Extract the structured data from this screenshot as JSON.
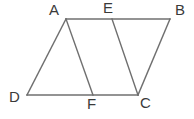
{
  "figure": {
    "kind": "geometry-diagram",
    "canvas": {
      "width": 194,
      "height": 119,
      "background": "#ffffff"
    },
    "style": {
      "line_color": "#6f6f6f",
      "line_width": 1.4,
      "label_color": "#3a3a3a",
      "label_font_size": 15
    },
    "points": [
      {
        "id": "A",
        "label": "A",
        "x": 66,
        "y": 19,
        "label_x": 49,
        "label_y": 2
      },
      {
        "id": "E",
        "label": "E",
        "x": 112,
        "y": 19,
        "label_x": 103,
        "label_y": 0
      },
      {
        "id": "B",
        "label": "B",
        "x": 170,
        "y": 19,
        "label_x": 175,
        "label_y": 2
      },
      {
        "id": "D",
        "label": "D",
        "x": 27,
        "y": 95,
        "label_x": 9,
        "label_y": 89
      },
      {
        "id": "F",
        "label": "F",
        "x": 93,
        "y": 95,
        "label_x": 87,
        "label_y": 96
      },
      {
        "id": "C",
        "label": "C",
        "x": 138,
        "y": 95,
        "label_x": 140,
        "label_y": 95
      }
    ],
    "segments": [
      {
        "id": "AB",
        "from": "A",
        "to": "B",
        "name": "segment-ab"
      },
      {
        "id": "DC",
        "from": "D",
        "to": "C",
        "name": "segment-dc"
      },
      {
        "id": "AD",
        "from": "A",
        "to": "D",
        "name": "segment-ad"
      },
      {
        "id": "AF",
        "from": "A",
        "to": "F",
        "name": "segment-af"
      },
      {
        "id": "EC",
        "from": "E",
        "to": "C",
        "name": "segment-ec"
      },
      {
        "id": "BC",
        "from": "B",
        "to": "C",
        "name": "segment-bc"
      }
    ]
  }
}
